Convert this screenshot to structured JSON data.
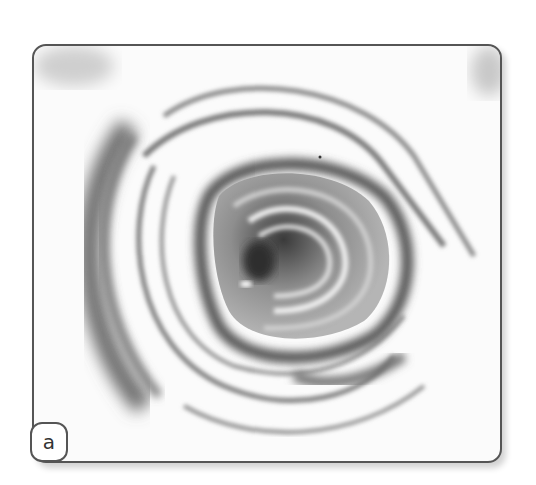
{
  "figure": {
    "panel_label": "a",
    "image_description": "endoscopic-view-lumen-with-concentric-folds",
    "colors": {
      "frame": "#555555",
      "background": "#fbfbfb",
      "fold_dark": "#555555",
      "fold_mid": "#8a8a8a",
      "lumen_dark": "#3a3a3a"
    }
  }
}
